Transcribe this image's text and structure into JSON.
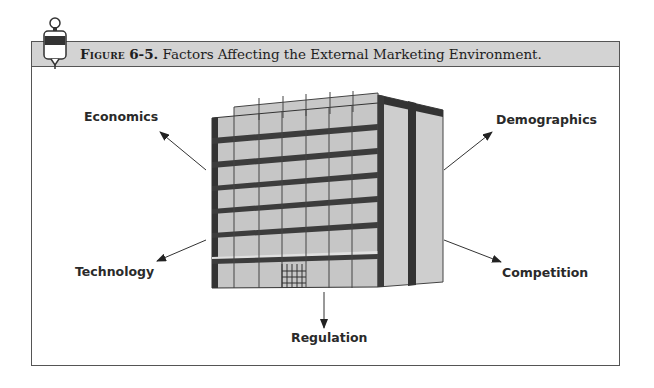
{
  "figure": {
    "label_prefix": "Figure",
    "number": "6-5.",
    "title": "Factors Affecting the External Marketing Environment.",
    "icon": "pushpin-marker-icon"
  },
  "diagram": {
    "center": "office-building-illustration",
    "factors": [
      {
        "id": "economics",
        "label": "Economics",
        "direction": "upper-left"
      },
      {
        "id": "demographics",
        "label": "Demographics",
        "direction": "upper-right"
      },
      {
        "id": "technology",
        "label": "Technology",
        "direction": "lower-left"
      },
      {
        "id": "competition",
        "label": "Competition",
        "direction": "lower-right"
      },
      {
        "id": "regulation",
        "label": "Regulation",
        "direction": "down"
      }
    ]
  },
  "colors": {
    "header_bg": "#d3d3d3",
    "frame_border": "#555555",
    "building_face": "#c8c8c8",
    "building_dark": "#3a3a3a",
    "building_side": "#cfcfcf"
  }
}
